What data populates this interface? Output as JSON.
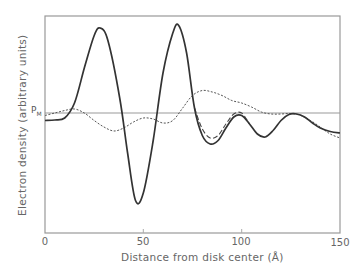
{
  "chart_data": {
    "type": "line",
    "title": "",
    "xlabel": "Distance from disk center (Å)",
    "ylabel": "Electron density (arbitrary units)",
    "xlim": [
      0,
      150
    ],
    "xticks": [
      0,
      50,
      100,
      150
    ],
    "ylim": "arbitrary",
    "grid": false,
    "legend": "none",
    "annotations": [
      {
        "text": "P",
        "subscript": "M",
        "meaning": "reference electron density level (horizontal line)"
      }
    ],
    "series": [
      {
        "name": "solid",
        "style": "solid-bold",
        "x": [
          0,
          5,
          10,
          15,
          20,
          25,
          28,
          32,
          38,
          42,
          46,
          50,
          55,
          60,
          65,
          68,
          72,
          76,
          80,
          84,
          88,
          92,
          96,
          100,
          104,
          108,
          112,
          116,
          120,
          124,
          128,
          132,
          136,
          140,
          145,
          150
        ],
        "y": [
          -0.15,
          -0.14,
          -0.1,
          0.2,
          0.9,
          1.55,
          1.7,
          1.45,
          0.3,
          -0.8,
          -1.75,
          -1.6,
          -0.55,
          0.8,
          1.6,
          1.75,
          1.2,
          0.1,
          -0.45,
          -0.62,
          -0.55,
          -0.3,
          -0.08,
          -0.05,
          -0.22,
          -0.42,
          -0.48,
          -0.35,
          -0.15,
          -0.03,
          -0.02,
          -0.08,
          -0.2,
          -0.3,
          -0.37,
          -0.4
        ]
      },
      {
        "name": "dashed",
        "style": "dashed",
        "x": [
          76,
          80,
          84,
          88,
          92,
          96,
          100,
          104
        ],
        "y": [
          0.1,
          -0.32,
          -0.5,
          -0.45,
          -0.22,
          -0.02,
          0.0,
          -0.22
        ]
      },
      {
        "name": "dotted",
        "style": "dotted",
        "x": [
          0,
          5,
          10,
          15,
          20,
          25,
          30,
          35,
          40,
          45,
          50,
          55,
          60,
          65,
          70,
          75,
          80,
          85,
          90,
          95,
          100,
          105,
          110,
          115,
          120,
          125,
          130,
          135,
          140,
          145,
          150
        ],
        "y": [
          -0.05,
          0.0,
          0.05,
          0.08,
          0.0,
          -0.15,
          -0.28,
          -0.36,
          -0.3,
          -0.18,
          -0.1,
          -0.12,
          -0.2,
          -0.15,
          0.1,
          0.35,
          0.45,
          0.42,
          0.35,
          0.25,
          0.2,
          0.12,
          0.02,
          -0.02,
          -0.02,
          -0.01,
          -0.05,
          -0.15,
          -0.28,
          -0.42,
          -0.5
        ]
      }
    ]
  }
}
